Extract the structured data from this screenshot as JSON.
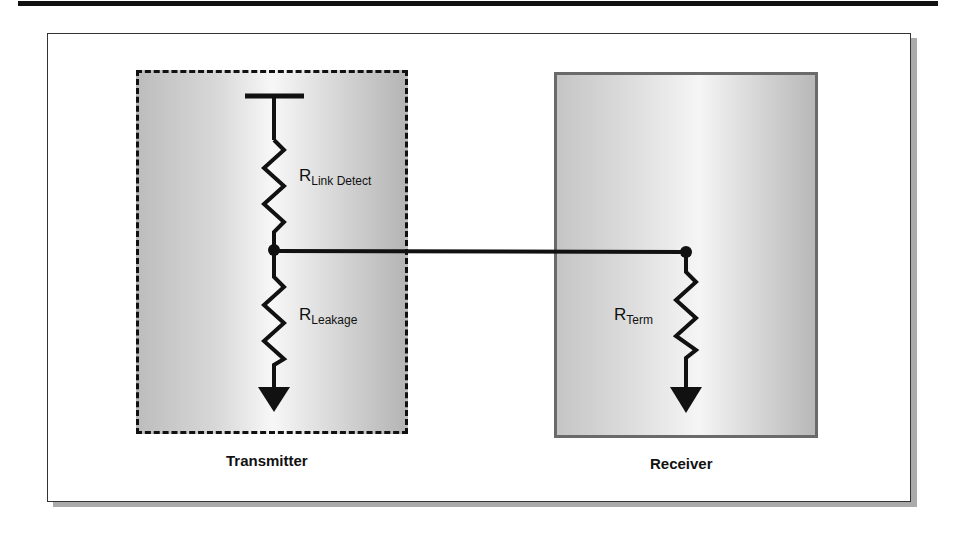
{
  "diagram": {
    "blocks": {
      "transmitter": {
        "label": "Transmitter",
        "border": "dashed"
      },
      "receiver": {
        "label": "Receiver",
        "border": "solid"
      }
    },
    "resistors": {
      "link_detect": {
        "main": "R",
        "sub": "Link Detect"
      },
      "leakage": {
        "main": "R",
        "sub": "Leakage"
      },
      "term": {
        "main": "R",
        "sub": "Term"
      }
    },
    "symbols": [
      "supply-rail",
      "ground-arrow",
      "ground-arrow",
      "junction-node",
      "junction-node"
    ],
    "connections": [
      "R Link Detect — node — R Leakage",
      "Transmitter node — Receiver node",
      "Receiver node — R Term — ground"
    ]
  }
}
